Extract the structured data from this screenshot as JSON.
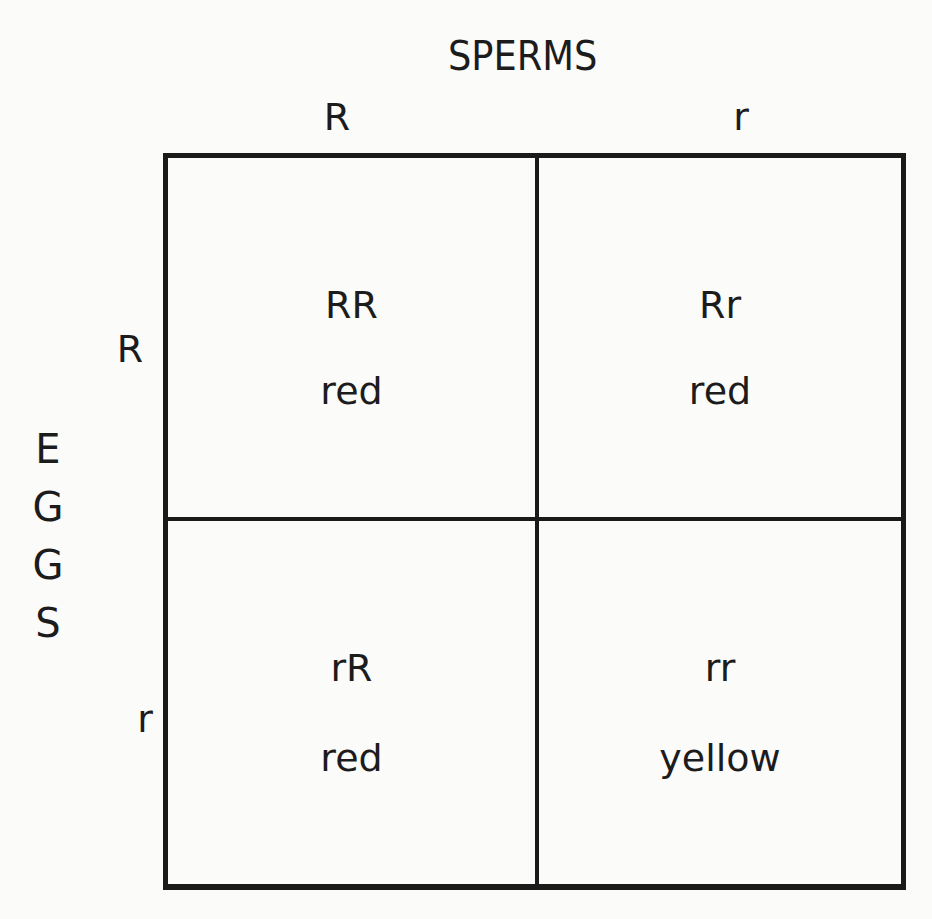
{
  "diagram": {
    "type": "punnett-square",
    "top_title": "SPERMS",
    "side_title": [
      "E",
      "G",
      "G",
      "S"
    ],
    "column_alleles": [
      "R",
      "r"
    ],
    "row_alleles": [
      "R",
      "r"
    ],
    "cells": [
      [
        {
          "genotype": "RR",
          "phenotype": "red"
        },
        {
          "genotype": "Rr",
          "phenotype": "red"
        }
      ],
      [
        {
          "genotype": "rR",
          "phenotype": "red"
        },
        {
          "genotype": "rr",
          "phenotype": "yellow"
        }
      ]
    ]
  },
  "colors": {
    "ink": "#1c1c1c",
    "paper": "#fbfbfa"
  }
}
